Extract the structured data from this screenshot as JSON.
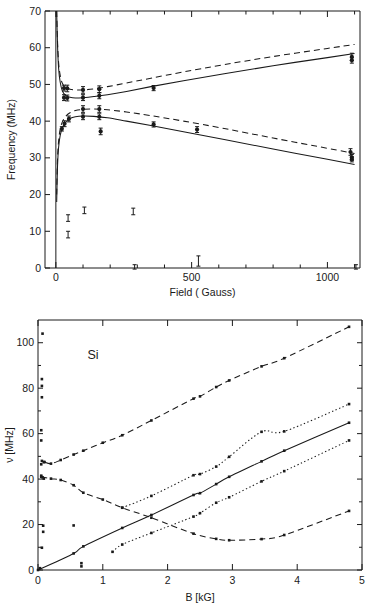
{
  "figure": {
    "caption_present": false,
    "panels": [
      "top",
      "bottom"
    ]
  },
  "chart_data": [
    {
      "id": "top",
      "type": "scatter",
      "title": "",
      "xlabel": "Field ( Gauss)",
      "ylabel": "Frequency (MHz)",
      "xlim": [
        -40,
        1120
      ],
      "ylim": [
        0,
        70
      ],
      "xticks": [
        0,
        500,
        1000
      ],
      "xticklabels": [
        "0",
        "500",
        "1000"
      ],
      "xminorticks": [
        100,
        200,
        300,
        400,
        600,
        700,
        800,
        900,
        1100
      ],
      "yticks": [
        0,
        10,
        20,
        30,
        40,
        50,
        60,
        70
      ],
      "yticklabels": [
        "0",
        "10",
        "20",
        "30",
        "40",
        "50",
        "60",
        "70"
      ],
      "grid": false,
      "legend": "none",
      "series": [
        {
          "name": "upper-branch-dashed-theory",
          "style": "dashed",
          "x": [
            3,
            6,
            10,
            16,
            24,
            36,
            52,
            72,
            100,
            140,
            190,
            260,
            350,
            470,
            620,
            800,
            1000,
            1100
          ],
          "y": [
            70.0,
            62.0,
            56.0,
            52.5,
            50.3,
            49.2,
            48.7,
            48.5,
            48.5,
            48.8,
            49.4,
            50.4,
            51.7,
            53.4,
            55.4,
            57.6,
            59.8,
            60.9
          ]
        },
        {
          "name": "upper-branch-solid-theory",
          "style": "solid",
          "x": [
            3,
            6,
            10,
            16,
            24,
            36,
            52,
            72,
            100,
            140,
            190,
            260,
            350,
            470,
            620,
            800,
            1000,
            1100
          ],
          "y": [
            70.0,
            61.0,
            54.5,
            50.6,
            48.2,
            47.0,
            46.5,
            46.3,
            46.4,
            46.7,
            47.2,
            48.1,
            49.4,
            51.0,
            52.9,
            55.1,
            57.3,
            58.4
          ]
        },
        {
          "name": "lower-branch-dashed-theory",
          "style": "dashed",
          "x": [
            3,
            6,
            10,
            16,
            24,
            36,
            52,
            72,
            100,
            140,
            190,
            260,
            350,
            470,
            620,
            800,
            1000,
            1100
          ],
          "y": [
            20.0,
            29.5,
            34.5,
            37.8,
            39.8,
            41.3,
            42.3,
            42.9,
            43.2,
            43.3,
            43.1,
            42.5,
            41.5,
            40.0,
            38.0,
            35.4,
            32.6,
            31.2
          ]
        },
        {
          "name": "lower-branch-solid-theory",
          "style": "solid",
          "x": [
            3,
            6,
            10,
            16,
            24,
            36,
            52,
            72,
            100,
            140,
            190,
            260,
            350,
            470,
            620,
            800,
            1000,
            1100
          ],
          "y": [
            18.0,
            27.5,
            32.8,
            36.1,
            38.2,
            39.7,
            40.7,
            41.2,
            41.4,
            41.3,
            40.9,
            40.0,
            38.8,
            37.1,
            35.0,
            32.4,
            29.6,
            28.2
          ]
        },
        {
          "name": "measured-upper-pair",
          "style": "points-errorbar",
          "points": [
            {
              "x": 30,
              "y": 49.0,
              "err": 0.8
            },
            {
              "x": 30,
              "y": 46.4,
              "err": 0.8
            },
            {
              "x": 42,
              "y": 48.9,
              "err": 0.9
            },
            {
              "x": 42,
              "y": 46.3,
              "err": 0.8
            },
            {
              "x": 100,
              "y": 48.5,
              "err": 0.9
            },
            {
              "x": 100,
              "y": 46.4,
              "err": 0.8
            },
            {
              "x": 160,
              "y": 48.7,
              "err": 0.9
            },
            {
              "x": 160,
              "y": 46.9,
              "err": 0.8
            },
            {
              "x": 360,
              "y": 49.0,
              "err": 0.7
            },
            {
              "x": 1090,
              "y": 57.5,
              "err": 1.0
            },
            {
              "x": 1090,
              "y": 56.6,
              "err": 0.8
            }
          ]
        },
        {
          "name": "measured-lower-pair",
          "style": "points-errorbar",
          "points": [
            {
              "x": 22,
              "y": 37.9,
              "err": 0.6
            },
            {
              "x": 32,
              "y": 39.3,
              "err": 0.8
            },
            {
              "x": 48,
              "y": 40.6,
              "err": 0.8
            },
            {
              "x": 100,
              "y": 43.3,
              "err": 0.9
            },
            {
              "x": 100,
              "y": 41.2,
              "err": 0.8
            },
            {
              "x": 160,
              "y": 43.3,
              "err": 0.9
            },
            {
              "x": 160,
              "y": 41.2,
              "err": 0.8
            },
            {
              "x": 165,
              "y": 37.2,
              "err": 0.9
            },
            {
              "x": 360,
              "y": 39.1,
              "err": 0.7
            },
            {
              "x": 520,
              "y": 37.7,
              "err": 0.8
            },
            {
              "x": 1085,
              "y": 31.6,
              "err": 0.9
            },
            {
              "x": 1090,
              "y": 30.1,
              "err": 0.8
            },
            {
              "x": 1090,
              "y": 29.6,
              "err": 0.7
            }
          ]
        },
        {
          "name": "measured-low-frequency",
          "style": "points-errorbar",
          "points": [
            {
              "x": 45,
              "y": 13.6,
              "err": 0.9
            },
            {
              "x": 45,
              "y": 9.1,
              "err": 0.9
            },
            {
              "x": 105,
              "y": 15.7,
              "err": 0.9
            },
            {
              "x": 285,
              "y": 15.4,
              "err": 0.9
            },
            {
              "x": 290,
              "y": 0.3,
              "err": 0.6
            },
            {
              "x": 525,
              "y": 1.9,
              "err": 1.4
            },
            {
              "x": 1105,
              "y": 0.3,
              "err": 0.6
            }
          ]
        }
      ]
    },
    {
      "id": "bottom",
      "type": "scatter",
      "title": "",
      "annotation": "Si",
      "xlabel": "B [kG]",
      "ylabel": "ν [MHz]",
      "xlim": [
        0,
        5
      ],
      "ylim": [
        0,
        110
      ],
      "xticks": [
        0,
        1,
        2,
        3,
        4,
        5
      ],
      "xticklabels": [
        "0",
        "1",
        "2",
        "3",
        "4",
        "5"
      ],
      "yticks": [
        0,
        20,
        40,
        60,
        80,
        100
      ],
      "yticklabels": [
        "0",
        "20",
        "40",
        "60",
        "80",
        "100"
      ],
      "yminorticks": [
        10,
        30,
        50,
        70,
        90
      ],
      "grid": false,
      "legend": "none",
      "series": [
        {
          "name": "branch-A-upper-dashed",
          "style": "dashed",
          "x": [
            0.1,
            0.2,
            0.35,
            0.55,
            0.7,
            1.0,
            1.3,
            1.75,
            2.4,
            2.5,
            2.75,
            2.95,
            3.45,
            3.8,
            4.8
          ],
          "y": [
            47.5,
            46.8,
            48.4,
            50.8,
            52.5,
            56.0,
            59.3,
            65.8,
            75.4,
            76.4,
            80.5,
            83.4,
            89.6,
            93.2,
            107.0
          ]
        },
        {
          "name": "branch-B-descending-dashed",
          "style": "dashed",
          "x": [
            0.05,
            0.2,
            0.35,
            0.55,
            0.7,
            1.0,
            1.3,
            1.75,
            2.4,
            2.75,
            2.95,
            3.45,
            3.8,
            4.8
          ],
          "y": [
            41.0,
            40.2,
            39.6,
            37.3,
            34.0,
            31.0,
            27.4,
            23.0,
            16.0,
            13.7,
            13.1,
            13.6,
            15.4,
            26.0
          ]
        },
        {
          "name": "branch-C-dotted-upper",
          "style": "dotted",
          "x": [
            1.3,
            1.75,
            2.4,
            2.5,
            2.75,
            2.95,
            3.45,
            3.8,
            4.8
          ],
          "y": [
            27.4,
            32.6,
            41.7,
            42.2,
            45.5,
            49.8,
            60.8,
            61.0,
            73.0
          ]
        },
        {
          "name": "branch-D-dotted-lower",
          "style": "dotted",
          "x": [
            1.15,
            1.3,
            1.75,
            2.4,
            2.5,
            2.75,
            2.95,
            3.45,
            3.8,
            4.8
          ],
          "y": [
            8.0,
            11.2,
            16.3,
            23.5,
            25.0,
            29.6,
            32.0,
            39.0,
            43.5,
            57.0
          ]
        },
        {
          "name": "branch-E-linear-solid",
          "style": "solid",
          "x": [
            0.0,
            0.55,
            0.7,
            1.3,
            1.75,
            2.4,
            2.5,
            2.75,
            2.95,
            3.45,
            3.8,
            4.8
          ],
          "y": [
            0.0,
            7.3,
            10.4,
            18.5,
            24.2,
            33.0,
            33.8,
            37.8,
            41.0,
            47.8,
            52.5,
            64.8
          ]
        },
        {
          "name": "scattered-low-field-points",
          "style": "points",
          "points": [
            {
              "x": 0.07,
              "y": 104.0
            },
            {
              "x": 0.06,
              "y": 84.0
            },
            {
              "x": 0.06,
              "y": 81.0
            },
            {
              "x": 0.06,
              "y": 76.0
            },
            {
              "x": 0.05,
              "y": 61.5
            },
            {
              "x": 0.05,
              "y": 57.0
            },
            {
              "x": 0.06,
              "y": 48.0
            },
            {
              "x": 0.09,
              "y": 47.5
            },
            {
              "x": 0.05,
              "y": 46.5
            },
            {
              "x": 0.05,
              "y": 41.5
            },
            {
              "x": 0.07,
              "y": 40.8
            },
            {
              "x": 0.09,
              "y": 40.2
            },
            {
              "x": 0.08,
              "y": 19.5
            },
            {
              "x": 0.08,
              "y": 16.8
            },
            {
              "x": 0.55,
              "y": 19.6
            },
            {
              "x": 0.06,
              "y": 9.8
            },
            {
              "x": 0.67,
              "y": 3.0
            },
            {
              "x": 0.67,
              "y": 1.6
            },
            {
              "x": 0.03,
              "y": 0.8
            }
          ]
        }
      ]
    }
  ]
}
